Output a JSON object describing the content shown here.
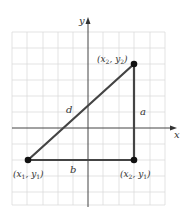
{
  "figure": {
    "axes": {
      "x_label": "x",
      "y_label": "y"
    },
    "grid": {
      "color": "#dcdcdc",
      "columns": 10,
      "rows": 11
    },
    "colors": {
      "grid": "#dcdcdc",
      "axes": "#444444",
      "triangle": "#444444",
      "points": "#111111",
      "text": "#333333"
    },
    "points": [
      {
        "id": "p1",
        "label_main": "(x",
        "sub1": "1",
        "mid": ", y",
        "sub2": "1",
        "end": ")"
      },
      {
        "id": "p2",
        "label_main": "(x",
        "sub1": "2",
        "mid": ", y",
        "sub2": "2",
        "end": ")"
      },
      {
        "id": "p3",
        "label_main": "(x",
        "sub1": "2",
        "mid": ", y",
        "sub2": "1",
        "end": ")"
      }
    ],
    "sides": {
      "hypotenuse": "d",
      "vertical": "a",
      "horizontal": "b"
    }
  }
}
